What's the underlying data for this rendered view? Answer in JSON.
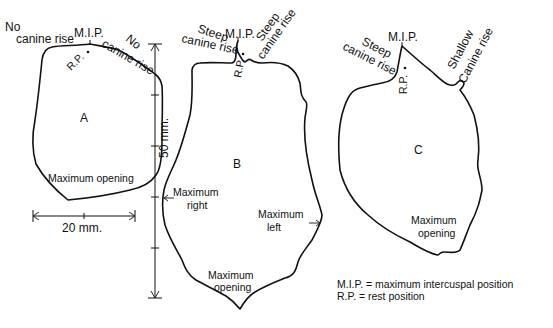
{
  "figure": {
    "panels": {
      "a": {
        "letter": "A",
        "left_label_line1": "No",
        "left_label_line2": "canine rise",
        "mip_label": "M.I.P.",
        "rp_label": "R.P.",
        "right_label_line1": "No",
        "right_label_line2": "canine rise",
        "bottom_label": "Maximum opening"
      },
      "b": {
        "letter": "B",
        "left_label_line1": "Steep",
        "left_label_line2": "canine rise",
        "mip_label": "M.I.P.",
        "rp_label": "R.P.",
        "right_label_line1": "Steep",
        "right_label_line2": "canine rise",
        "right_side_line1": "Maximum",
        "right_side_line2": "right",
        "left_side_line1": "Maximum",
        "left_side_line2": "left",
        "bottom_line1": "Maximum",
        "bottom_line2": "opening"
      },
      "c": {
        "letter": "C",
        "left_label_line1": "Steep",
        "left_label_line2": "canine rise",
        "mip_label": "M.I.P.",
        "rp_label": "R.P.",
        "right_label_line1": "Shallow",
        "right_label_line2": "Canine rise",
        "bottom_line1": "Maximum",
        "bottom_line2": "opening"
      }
    },
    "scales": {
      "horizontal": "20 mm.",
      "vertical": "50 mm."
    },
    "legend": {
      "line1": "M.I.P. = maximum intercuspal position",
      "line2": "R.P. = rest position"
    }
  }
}
